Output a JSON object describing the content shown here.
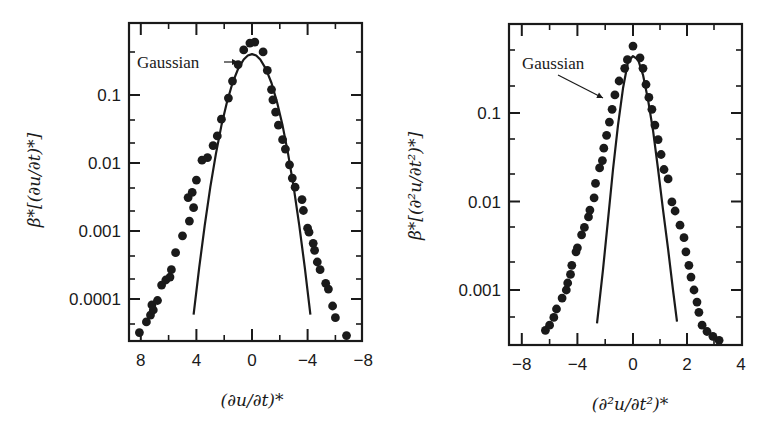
{
  "chart_data": [
    {
      "type": "scatter",
      "panel": "left",
      "title": "",
      "xlabel": "(∂u/∂t)*",
      "ylabel": "β*[(∂u/∂t)*]",
      "xscale": "linear",
      "yscale": "log",
      "x_inverted": true,
      "xlim": [
        8.2,
        -8.2
      ],
      "ylim": [
        2.4e-05,
        1.1
      ],
      "xticks": [
        8,
        4,
        0,
        -4,
        -8
      ],
      "xtick_labels": [
        "8",
        "4",
        "0",
        "−4",
        "−8"
      ],
      "yticks": [
        0.1,
        0.01,
        0.001,
        0.0001
      ],
      "ytick_labels": [
        "0.1",
        "0.01",
        "0.001",
        "0.0001"
      ],
      "grid": false,
      "annotation": {
        "text": "Gaussian",
        "arrow": true
      },
      "series": [
        {
          "name": "measured PDF",
          "marker": "filled-circle",
          "points": [
            [
              8.1,
              3.2e-05
            ],
            [
              7.6,
              4.6e-05
            ],
            [
              7.3,
              5.8e-05
            ],
            [
              7.1,
              6.9e-05
            ],
            [
              7.2,
              8.2e-05
            ],
            [
              6.8,
              9.5e-05
            ],
            [
              6.5,
              0.00016
            ],
            [
              6.2,
              0.00019
            ],
            [
              5.9,
              0.00021
            ],
            [
              5.8,
              0.00027
            ],
            [
              5.5,
              0.00048
            ],
            [
              5.0,
              0.00085
            ],
            [
              4.5,
              0.0014
            ],
            [
              4.2,
              0.0022
            ],
            [
              4.6,
              0.0031
            ],
            [
              4.3,
              0.0037
            ],
            [
              4.0,
              0.0056
            ],
            [
              3.6,
              0.011
            ],
            [
              3.2,
              0.012
            ],
            [
              2.8,
              0.018
            ],
            [
              2.5,
              0.025
            ],
            [
              2.2,
              0.044
            ],
            [
              1.7,
              0.09
            ],
            [
              1.4,
              0.16
            ],
            [
              1.0,
              0.28
            ],
            [
              0.6,
              0.46
            ],
            [
              0.15,
              0.58
            ],
            [
              -0.2,
              0.6
            ],
            [
              -0.8,
              0.43
            ],
            [
              -1.1,
              0.23
            ],
            [
              -1.4,
              0.12
            ],
            [
              -1.5,
              0.085
            ],
            [
              -1.7,
              0.056
            ],
            [
              -1.9,
              0.036
            ],
            [
              -2.2,
              0.022
            ],
            [
              -2.4,
              0.016
            ],
            [
              -2.7,
              0.0094
            ],
            [
              -2.9,
              0.006
            ],
            [
              -3.1,
              0.0044
            ],
            [
              -3.6,
              0.0029
            ],
            [
              -3.7,
              0.002
            ],
            [
              -4.0,
              0.0011
            ],
            [
              -4.1,
              0.00096
            ],
            [
              -4.4,
              0.00066
            ],
            [
              -4.5,
              0.00052
            ],
            [
              -4.7,
              0.00035
            ],
            [
              -4.9,
              0.00027
            ],
            [
              -5.3,
              0.00017
            ],
            [
              -5.5,
              0.00014
            ],
            [
              -5.8,
              7.9e-05
            ],
            [
              -6.0,
              5.3e-05
            ],
            [
              -6.8,
              2.9e-05
            ]
          ]
        },
        {
          "name": "Gaussian",
          "line": "solid",
          "points": [
            [
              4.2,
              5.9e-05
            ],
            [
              3.8,
              0.00029
            ],
            [
              3.4,
              0.0012
            ],
            [
              3.0,
              0.0044
            ],
            [
              2.6,
              0.0136
            ],
            [
              2.2,
              0.0355
            ],
            [
              1.8,
              0.079
            ],
            [
              1.4,
              0.15
            ],
            [
              1.0,
              0.242
            ],
            [
              0.6,
              0.333
            ],
            [
              0.3,
              0.381
            ],
            [
              0.0,
              0.399
            ],
            [
              -0.3,
              0.381
            ],
            [
              -0.6,
              0.333
            ],
            [
              -1.0,
              0.242
            ],
            [
              -1.4,
              0.15
            ],
            [
              -1.8,
              0.079
            ],
            [
              -2.2,
              0.0355
            ],
            [
              -2.6,
              0.0136
            ],
            [
              -3.0,
              0.0044
            ],
            [
              -3.4,
              0.0012
            ],
            [
              -3.8,
              0.00029
            ],
            [
              -4.2,
              5.9e-05
            ]
          ]
        }
      ]
    },
    {
      "type": "scatter",
      "panel": "right",
      "title": "",
      "xlabel": "(∂²u/∂t²)*",
      "ylabel": "β*[(∂²u/∂t²)*]",
      "xscale": "linear",
      "yscale": "log",
      "xlim": [
        -8.8,
        4
      ],
      "ylim": [
        0.00026,
        0.9
      ],
      "xticks": [
        -8,
        -4,
        0,
        2,
        4
      ],
      "xtick_labels": [
        "−8",
        "−4",
        "0",
        "2",
        "4"
      ],
      "yticks": [
        0.1,
        0.01,
        0.001
      ],
      "ytick_labels": [
        "0.1",
        "0.01",
        "0.001"
      ],
      "grid": false,
      "annotation": {
        "text": "Gaussian",
        "arrow": true
      },
      "series": [
        {
          "name": "measured PDF",
          "marker": "filled-circle",
          "points": [
            [
              -6.3,
              0.00035
            ],
            [
              -6.0,
              0.0004
            ],
            [
              -5.7,
              0.00049
            ],
            [
              -5.5,
              0.00061
            ],
            [
              -5.1,
              0.00081
            ],
            [
              -4.8,
              0.001
            ],
            [
              -4.7,
              0.0012
            ],
            [
              -4.5,
              0.0015
            ],
            [
              -4.4,
              0.0019
            ],
            [
              -4.1,
              0.0027
            ],
            [
              -4.0,
              0.003
            ],
            [
              -3.7,
              0.0042
            ],
            [
              -3.5,
              0.0051
            ],
            [
              -3.2,
              0.0067
            ],
            [
              -3.1,
              0.008
            ],
            [
              -2.8,
              0.011
            ],
            [
              -2.7,
              0.016
            ],
            [
              -2.4,
              0.024
            ],
            [
              -2.2,
              0.029
            ],
            [
              -2.1,
              0.04
            ],
            [
              -1.9,
              0.056
            ],
            [
              -1.7,
              0.079
            ],
            [
              -1.5,
              0.11
            ],
            [
              -1.3,
              0.16
            ],
            [
              -1.0,
              0.23
            ],
            [
              -0.6,
              0.32
            ],
            [
              -0.4,
              0.4
            ],
            [
              0.0,
              0.57
            ],
            [
              0.26,
              0.42
            ],
            [
              0.37,
              0.32
            ],
            [
              0.48,
              0.21
            ],
            [
              0.59,
              0.15
            ],
            [
              0.7,
              0.11
            ],
            [
              0.81,
              0.073
            ],
            [
              0.93,
              0.05
            ],
            [
              1.04,
              0.034
            ],
            [
              1.15,
              0.023
            ],
            [
              1.3,
              0.018
            ],
            [
              1.44,
              0.0099
            ],
            [
              1.56,
              0.0078
            ],
            [
              1.74,
              0.0054
            ],
            [
              1.89,
              0.0039
            ],
            [
              1.96,
              0.0027
            ],
            [
              2.07,
              0.0019
            ],
            [
              2.15,
              0.0014
            ],
            [
              2.26,
              0.001
            ],
            [
              2.37,
              0.00073
            ],
            [
              2.44,
              0.00056
            ],
            [
              2.56,
              0.0004
            ],
            [
              2.74,
              0.00034
            ],
            [
              2.96,
              0.0003
            ],
            [
              3.19,
              0.00027
            ]
          ]
        },
        {
          "name": "Gaussian",
          "line": "solid",
          "points": [
            [
              -2.59,
              0.00042
            ],
            [
              -2.16,
              0.0017
            ],
            [
              -1.8,
              0.0062
            ],
            [
              -1.44,
              0.023
            ],
            [
              -1.08,
              0.073
            ],
            [
              -0.72,
              0.19
            ],
            [
              -0.36,
              0.38
            ],
            [
              0.0,
              0.44
            ],
            [
              0.19,
              0.4
            ],
            [
              0.37,
              0.27
            ],
            [
              0.56,
              0.14
            ],
            [
              0.74,
              0.064
            ],
            [
              0.93,
              0.023
            ],
            [
              1.11,
              0.0081
            ],
            [
              1.3,
              0.0029
            ],
            [
              1.48,
              0.001
            ],
            [
              1.63,
              0.00044
            ]
          ]
        }
      ]
    }
  ],
  "layout": {
    "panels": [
      {
        "frame": {
          "x0": 129,
          "y0": 23,
          "x1": 362,
          "y1": 341
        },
        "xmap": {
          "type": "linear",
          "zero_px": 252,
          "px_per_unit_neg": 13.9,
          "px_per_unit_pos": 13.9,
          "invert": true
        },
        "ymap": {
          "ref_value": 0.1,
          "ref_px": 95,
          "px_per_decade": 68
        },
        "xtick_minor": [
          6,
          2,
          -2,
          -6
        ],
        "ytick_minor_px": [
          52,
          120,
          143,
          188,
          211,
          256,
          279,
          324
        ],
        "annotation_pos": {
          "tx": 137,
          "ty": 68,
          "ax0": 224,
          "ay0": 62,
          "ax1": 238,
          "ay1": 62
        },
        "ylabel_pos": {
          "x": 40,
          "y": 180
        },
        "xlabel_pos": {
          "x": 252,
          "y": 406
        }
      },
      {
        "frame": {
          "x0": 509,
          "y0": 24,
          "x1": 742,
          "y1": 345
        },
        "xmap": {
          "type": "piecewise",
          "zero_px": 633,
          "px_per_unit_neg": 13.9,
          "px_per_unit_pos": 27.0,
          "invert": false
        },
        "ymap": {
          "ref_value": 0.1,
          "ref_px": 113,
          "px_per_decade": 88.5
        },
        "xtick_minor": [
          -6,
          -2,
          1,
          3
        ],
        "ytick_minor_px": [
          50,
          86,
          139,
          174,
          227,
          262,
          317
        ],
        "annotation_pos": {
          "tx": 522,
          "ty": 69,
          "ax0": 558,
          "ay0": 75,
          "ax1": 603,
          "ay1": 98
        },
        "ylabel_pos": {
          "x": 421,
          "y": 186
        },
        "xlabel_pos": {
          "x": 630,
          "y": 410
        }
      }
    ]
  },
  "colors": {
    "ink": "#1a1a1a",
    "background": "#ffffff"
  }
}
